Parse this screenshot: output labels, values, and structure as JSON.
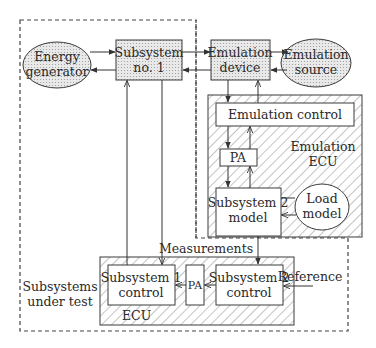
{
  "diagram": {
    "regions": {
      "subsystems_under_test": {
        "label_line1": "Subsystems",
        "label_line2": "under test"
      },
      "emulation_ecu": {
        "label_line1": "Emulation",
        "label_line2": "ECU"
      },
      "ecu": {
        "label": "ECU"
      }
    },
    "nodes": {
      "energy_generator": {
        "line1": "Energy",
        "line2": "generator",
        "shape": "ellipse"
      },
      "subsystem_1": {
        "line1": "Subsystem",
        "line2": "no. 1",
        "shape": "box"
      },
      "emulation_device": {
        "line1": "Emulation",
        "line2": "device",
        "shape": "box"
      },
      "emulation_source": {
        "line1": "Emulation",
        "line2": "source",
        "shape": "ellipse"
      },
      "emulation_control": {
        "label": "Emulation control",
        "shape": "box"
      },
      "pa_emulation": {
        "label": "PA",
        "shape": "box"
      },
      "subsystem_2_model": {
        "line1": "Subsystem 2",
        "line2": "model",
        "shape": "box"
      },
      "load_model": {
        "line1": "Load",
        "line2": "model",
        "shape": "ellipse"
      },
      "subsystem_1_control": {
        "line1": "Subsystem 1",
        "line2": "control",
        "shape": "box"
      },
      "pa_ecu": {
        "label": "PA",
        "shape": "box"
      },
      "subsystem_2_control": {
        "line1": "Subsystem 2",
        "line2": "control",
        "shape": "box"
      }
    },
    "edge_labels": {
      "measurements": "Measurements",
      "reference": "Reference"
    },
    "colors": {
      "stroke": "#3a3a3a",
      "fill_dotted": "#d8d8d8",
      "hatch": "#8a8a8a",
      "background": "#ffffff"
    }
  }
}
